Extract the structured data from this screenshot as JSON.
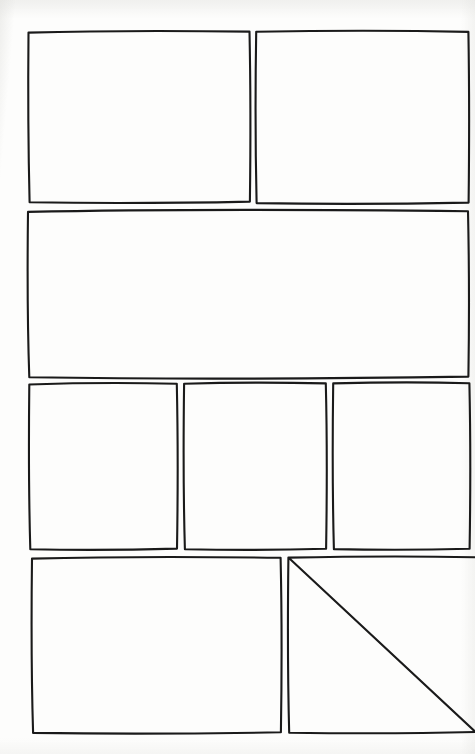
{
  "page": {
    "kind": "comic-page-layout",
    "width": 475,
    "height": 754,
    "paper_color": "#fdfdfc",
    "ink_color": "#1a1a1a",
    "style": "hand-drawn",
    "panel_count": 8,
    "row_count": 4,
    "content_note": ""
  },
  "rows": [
    {
      "name": "row-1",
      "panel_count": 2,
      "top": 31,
      "bottom": 203
    },
    {
      "name": "row-2",
      "panel_count": 1,
      "top": 211,
      "bottom": 377
    },
    {
      "name": "row-3",
      "panel_count": 3,
      "top": 383,
      "bottom": 549
    },
    {
      "name": "row-4",
      "panel_count": 2,
      "top": 557,
      "bottom": 733
    }
  ],
  "panels": [
    {
      "id": "panel-1",
      "row": 1,
      "index_in_row": 1,
      "label": "",
      "x": 27,
      "y": 31,
      "width": 223,
      "height": 172
    },
    {
      "id": "panel-2",
      "row": 1,
      "index_in_row": 2,
      "label": "",
      "x": 256,
      "y": 31,
      "width": 212,
      "height": 172
    },
    {
      "id": "panel-3",
      "row": 2,
      "index_in_row": 1,
      "label": "",
      "x": 27,
      "y": 211,
      "width": 441,
      "height": 166
    },
    {
      "id": "panel-4",
      "row": 3,
      "index_in_row": 1,
      "label": "",
      "x": 28,
      "y": 383,
      "width": 149,
      "height": 166
    },
    {
      "id": "panel-5",
      "row": 3,
      "index_in_row": 2,
      "label": "",
      "x": 184,
      "y": 383,
      "width": 142,
      "height": 166
    },
    {
      "id": "panel-6",
      "row": 3,
      "index_in_row": 3,
      "label": "",
      "x": 333,
      "y": 383,
      "width": 136,
      "height": 166
    },
    {
      "id": "panel-7",
      "row": 4,
      "index_in_row": 1,
      "label": "",
      "x": 31,
      "y": 557,
      "width": 250,
      "height": 176
    },
    {
      "id": "panel-8",
      "row": 4,
      "index_in_row": 2,
      "label": "",
      "x": 288,
      "y": 557,
      "width": 186,
      "height": 176
    }
  ]
}
